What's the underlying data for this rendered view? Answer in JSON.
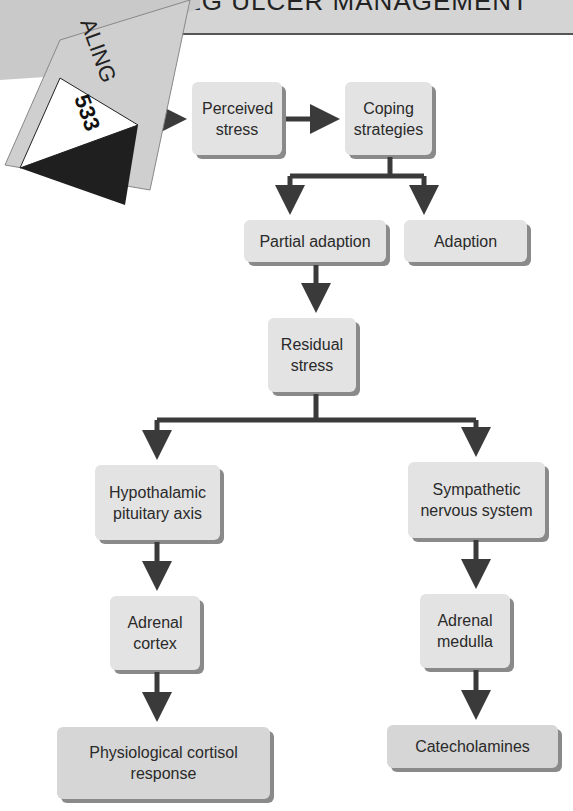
{
  "header": {
    "title": "LEG ULCER MANAGEMENT"
  },
  "page_tab": {
    "section_label": "ALING",
    "page_number": "533"
  },
  "nodes": {
    "perceived_stress": "Perceived stress",
    "coping_strategies": "Coping strategies",
    "partial_adaption": "Partial adaption",
    "adaption": "Adaption",
    "residual_stress": "Residual stress",
    "hpa": "Hypothalamic pituitary axis",
    "sns": "Sympathetic nervous system",
    "adrenal_cortex": "Adrenal cortex",
    "adrenal_medulla": "Adrenal medulla",
    "cortisol": "Physiological cortisol response",
    "catecholamines": "Catecholamines"
  },
  "colors": {
    "box_fill": "#e3e3e3",
    "box_shadow": "#8a8a8a",
    "arrow": "#3a3a3a",
    "header_band": "#d4d4d4"
  }
}
